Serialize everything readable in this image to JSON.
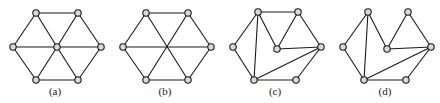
{
  "figure": {
    "background_color": "#ffffff",
    "edge_color": "#1a1a1a",
    "vertex_fill": "#d9d9d9",
    "vertex_stroke": "#1a1a1a",
    "vertex_radius": 3.2,
    "edge_width": 1.1
  },
  "panels": [
    {
      "id": "a",
      "caption": "(a)",
      "description": "hexagon with hub vertex joined to all six rim vertices",
      "vertices": [
        {
          "name": "left",
          "x": 13,
          "y": 47
        },
        {
          "name": "top-left",
          "x": 36,
          "y": 13
        },
        {
          "name": "top-right",
          "x": 78,
          "y": 13
        },
        {
          "name": "right",
          "x": 101,
          "y": 47
        },
        {
          "name": "bottom-right",
          "x": 78,
          "y": 80
        },
        {
          "name": "bottom-left",
          "x": 36,
          "y": 80
        },
        {
          "name": "center",
          "x": 57,
          "y": 47
        }
      ],
      "edges": [
        [
          0,
          1
        ],
        [
          1,
          2
        ],
        [
          2,
          3
        ],
        [
          3,
          4
        ],
        [
          4,
          5
        ],
        [
          5,
          0
        ],
        [
          6,
          0
        ],
        [
          6,
          1
        ],
        [
          6,
          2
        ],
        [
          6,
          3
        ],
        [
          6,
          4
        ],
        [
          6,
          5
        ]
      ]
    },
    {
      "id": "b",
      "caption": "(b)",
      "description": "hexagon with three long diagonals crossing at an uncircled midpoint",
      "vertices": [
        {
          "name": "left",
          "x": 13,
          "y": 47
        },
        {
          "name": "top-left",
          "x": 36,
          "y": 13
        },
        {
          "name": "top-right",
          "x": 78,
          "y": 13
        },
        {
          "name": "right",
          "x": 101,
          "y": 47
        },
        {
          "name": "bottom-right",
          "x": 78,
          "y": 80
        },
        {
          "name": "bottom-left",
          "x": 36,
          "y": 80
        }
      ],
      "edges": [
        [
          0,
          1
        ],
        [
          1,
          2
        ],
        [
          2,
          3
        ],
        [
          3,
          4
        ],
        [
          4,
          5
        ],
        [
          5,
          0
        ],
        [
          0,
          3
        ],
        [
          1,
          4
        ],
        [
          2,
          5
        ]
      ]
    },
    {
      "id": "c",
      "caption": "(c)",
      "description": "hexagon rim with interior vertex and chords; top rim edge present",
      "vertices": [
        {
          "name": "left",
          "x": 13,
          "y": 47
        },
        {
          "name": "top-left",
          "x": 38,
          "y": 12
        },
        {
          "name": "top-right",
          "x": 78,
          "y": 12
        },
        {
          "name": "right",
          "x": 101,
          "y": 47
        },
        {
          "name": "bottom-right",
          "x": 76,
          "y": 80
        },
        {
          "name": "bottom-left",
          "x": 34,
          "y": 80
        },
        {
          "name": "inner",
          "x": 57,
          "y": 49
        }
      ],
      "edges": [
        [
          0,
          1
        ],
        [
          1,
          2
        ],
        [
          2,
          3
        ],
        [
          3,
          4
        ],
        [
          4,
          5
        ],
        [
          5,
          0
        ],
        [
          1,
          5
        ],
        [
          6,
          1
        ],
        [
          6,
          2
        ],
        [
          6,
          3
        ],
        [
          3,
          5
        ]
      ]
    },
    {
      "id": "d",
      "caption": "(d)",
      "description": "same as (c) but the top rim edge is missing",
      "vertices": [
        {
          "name": "left",
          "x": 13,
          "y": 47
        },
        {
          "name": "top-left",
          "x": 38,
          "y": 12
        },
        {
          "name": "top-right",
          "x": 78,
          "y": 12
        },
        {
          "name": "right",
          "x": 101,
          "y": 47
        },
        {
          "name": "bottom-right",
          "x": 76,
          "y": 80
        },
        {
          "name": "bottom-left",
          "x": 34,
          "y": 80
        },
        {
          "name": "inner",
          "x": 57,
          "y": 49
        }
      ],
      "edges": [
        [
          0,
          1
        ],
        [
          2,
          3
        ],
        [
          3,
          4
        ],
        [
          4,
          5
        ],
        [
          5,
          0
        ],
        [
          1,
          5
        ],
        [
          6,
          1
        ],
        [
          6,
          2
        ],
        [
          6,
          3
        ],
        [
          3,
          5
        ]
      ]
    }
  ]
}
